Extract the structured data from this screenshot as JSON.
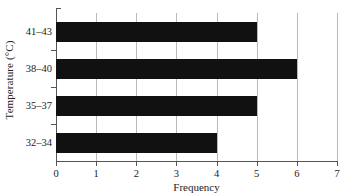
{
  "chart_data": {
    "type": "bar",
    "orientation": "horizontal",
    "title": "",
    "xlabel": "Frequency",
    "ylabel": "Temperature (°C)",
    "categories": [
      "32–34",
      "35–37",
      "38–40",
      "41–43"
    ],
    "values": [
      4,
      5,
      6,
      5
    ],
    "series": [
      {
        "name": "Frequency",
        "values": [
          4,
          5,
          6,
          5
        ]
      }
    ],
    "xlim": [
      0,
      7
    ],
    "xticks": [
      0,
      1,
      2,
      3,
      4,
      5,
      6,
      7
    ],
    "xtick_labels": [
      "0",
      "1",
      "2",
      "3",
      "4",
      "5",
      "6",
      "7"
    ],
    "ytick_labels": [
      "41–43",
      "38–40",
      "35–37",
      "32–34"
    ],
    "grid": "vertical",
    "legend": "none",
    "bar_color": "#111111",
    "grid_color": "#b9b9b9",
    "axis_color": "#555555"
  },
  "axes": {
    "x_title": "Frequency",
    "y_title": "Temperature (°C)"
  },
  "x_ticks": [
    {
      "label": "0",
      "value": 0
    },
    {
      "label": "1",
      "value": 1
    },
    {
      "label": "2",
      "value": 2
    },
    {
      "label": "3",
      "value": 3
    },
    {
      "label": "4",
      "value": 4
    },
    {
      "label": "5",
      "value": 5
    },
    {
      "label": "6",
      "value": 6
    },
    {
      "label": "7",
      "value": 7
    }
  ],
  "bars": [
    {
      "label": "41–43",
      "value": 5
    },
    {
      "label": "38–40",
      "value": 6
    },
    {
      "label": "35–37",
      "value": 5
    },
    {
      "label": "32–34",
      "value": 4
    }
  ]
}
